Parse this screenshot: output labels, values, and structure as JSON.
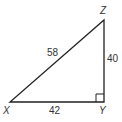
{
  "diagram": {
    "type": "right-triangle",
    "vertices": {
      "X": {
        "label": "X"
      },
      "Y": {
        "label": "Y"
      },
      "Z": {
        "label": "Z"
      }
    },
    "sides": {
      "XZ": {
        "label": "58"
      },
      "YZ": {
        "label": "40"
      },
      "XY": {
        "label": "42"
      }
    },
    "right_angle_at": "Y",
    "stroke_color": "#222222"
  }
}
